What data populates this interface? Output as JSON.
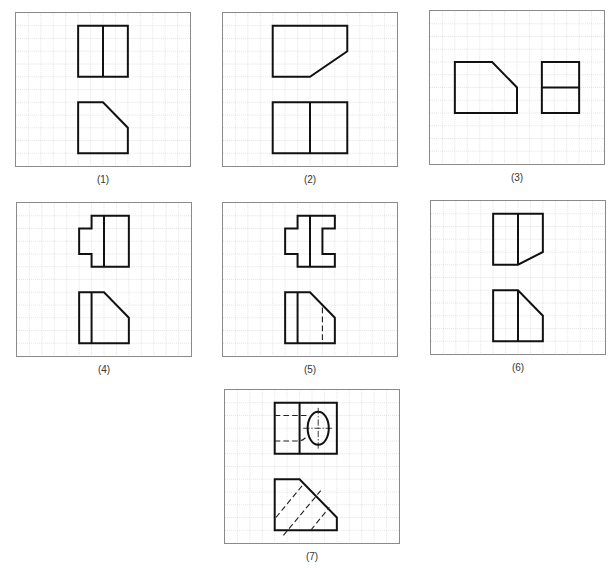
{
  "figure": {
    "grid": {
      "cols": 14,
      "rows": 12,
      "cell_px": 12.5
    },
    "panels": [
      {
        "id": "1",
        "label": "(1)",
        "box": {
          "left": 15,
          "top": 12
        },
        "solid_paths": [
          "M5 1 H9 V5 H5 Z",
          "M7 1 V5",
          "M5 7 H7 L9 9 V11 H5 Z"
        ],
        "dashed_paths": [],
        "ellipses": []
      },
      {
        "id": "2",
        "label": "(2)",
        "box": {
          "left": 222,
          "top": 12
        },
        "solid_paths": [
          "M4 1 H10 V3 L7 5 H4 Z",
          "M4 7 H10 V11 H4 Z",
          "M7 7 V11"
        ],
        "dashed_paths": [],
        "ellipses": []
      },
      {
        "id": "3",
        "label": "(3)",
        "box": {
          "left": 429,
          "top": 10
        },
        "solid_paths": [
          "M2 4 H5 L7 6 V8 H2 Z",
          "M9 4 H12 V8 H9 Z",
          "M9 6 H12"
        ],
        "dashed_paths": [],
        "ellipses": []
      },
      {
        "id": "4",
        "label": "(4)",
        "box": {
          "left": 16,
          "top": 202
        },
        "solid_paths": [
          "M6 1 H9 V5 H6 V4 H5 V2 H6 Z",
          "M7 1 V5",
          "M5 7 H7 L9 9 V11 H5 Z",
          "M6 7 V11"
        ],
        "dashed_paths": [],
        "ellipses": []
      },
      {
        "id": "5",
        "label": "(5)",
        "box": {
          "left": 222,
          "top": 202
        },
        "solid_paths": [
          "M6 1 H9 V2 H8 V4 H9 V5 H6 V4 H5 V2 H6 Z",
          "M7 1 V5",
          "M5 7 H7 L9 9 V11 H5 Z",
          "M6 7 V11"
        ],
        "dashed_paths": [
          "M8 8.2 V11"
        ],
        "ellipses": []
      },
      {
        "id": "6",
        "label": "(6)",
        "box": {
          "left": 430,
          "top": 200
        },
        "solid_paths": [
          "M5 1 H9 V4 L7 5 H5 Z",
          "M7 1 V5",
          "M5 7 H7 L9 9 V11 H5 Z",
          "M7 7 V11"
        ],
        "dashed_paths": [],
        "ellipses": []
      },
      {
        "id": "7",
        "label": "(7)",
        "box": {
          "left": 224,
          "top": 389
        },
        "solid_paths": [
          "M4 1 H9 V5 H4 Z",
          "M6 1 V5",
          "M4 7 H6 L9 10 V11 H4 Z"
        ],
        "dashed_paths": [
          "M4 2 H6.6",
          "M4 4 H5.9 Q6.3 4 6.6 3.6",
          "M4.1 10 L6.3 7.4",
          "M4.7 11.4 L7.7 7.9",
          "M6.9 11 L8.4 9.2"
        ],
        "center_paths": [
          "M6.3 3 H8.7",
          "M7.5 1.4 V4.6"
        ],
        "ellipses": [
          {
            "cx": 7.5,
            "cy": 3,
            "rx": 0.85,
            "ry": 1.3
          }
        ]
      }
    ]
  }
}
